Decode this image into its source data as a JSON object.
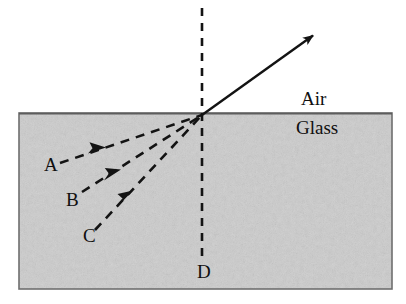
{
  "figure": {
    "media": {
      "upper_label": "Air",
      "lower_label": "Glass"
    },
    "colors": {
      "glass_fill": "#d2d2d2",
      "glass_border": "#6e6e6e",
      "ray_stroke": "#131313",
      "normal_stroke": "#131313",
      "text": "#100f0f",
      "background": "#ffffff"
    },
    "interface": {
      "description": "horizontal boundary between glass and air",
      "y": 113,
      "x_start": 19,
      "x_end": 392
    },
    "incidence_point": {
      "x": 202,
      "y": 115,
      "label": "point of incidence"
    },
    "normal": {
      "label": "D",
      "style": "dashed",
      "x": 202,
      "y_top": 8,
      "y_bottom": 262
    },
    "refracted_ray": {
      "label": "",
      "style": "solid",
      "arrow": "single-head-end",
      "from": {
        "x": 202,
        "y": 115
      },
      "to": {
        "x": 316,
        "y": 33
      }
    },
    "incident_rays": [
      {
        "label": "A",
        "style": "dashed",
        "arrow": "mid-head",
        "from": {
          "x": 60,
          "y": 163
        },
        "to": {
          "x": 202,
          "y": 115
        }
      },
      {
        "label": "B",
        "style": "dashed",
        "arrow": "mid-head",
        "from": {
          "x": 82,
          "y": 192
        },
        "to": {
          "x": 202,
          "y": 115
        }
      },
      {
        "label": "C",
        "style": "dashed",
        "arrow": "mid-head",
        "from": {
          "x": 95,
          "y": 230
        },
        "to": {
          "x": 202,
          "y": 115
        }
      }
    ],
    "glass_block": {
      "x": 19,
      "y": 113,
      "width": 373,
      "height": 176
    }
  }
}
